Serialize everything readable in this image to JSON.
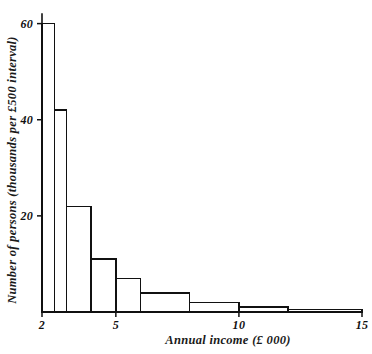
{
  "chart_data": {
    "type": "bar",
    "title": "",
    "subtitle": "",
    "xlabel": "Annual income (£ 000)",
    "ylabel": "Number of persons (thousands per £500 interval)",
    "xlim": [
      2,
      15
    ],
    "ylim": [
      0,
      62
    ],
    "grid": false,
    "legend": null,
    "x_ticks": [
      {
        "value": 2,
        "label": "2"
      },
      {
        "value": 5,
        "label": "5"
      },
      {
        "value": 10,
        "label": "10"
      },
      {
        "value": 15,
        "label": "15"
      }
    ],
    "y_ticks": [
      {
        "value": 20,
        "label": "20"
      },
      {
        "value": 40,
        "label": "40"
      },
      {
        "value": 60,
        "label": "60"
      }
    ],
    "bin_edges": [
      2,
      2.5,
      3,
      4,
      5,
      6,
      8,
      10,
      12,
      15
    ],
    "categories": [
      "2-2.5",
      "2.5-3",
      "3-4",
      "4-5",
      "5-6",
      "6-8",
      "8-10",
      "10-12",
      "12-15"
    ],
    "values": [
      60,
      42,
      22,
      11,
      7,
      4,
      2,
      1,
      0.5
    ],
    "bars": [
      {
        "x0": 2,
        "x1": 2.5,
        "height": 60
      },
      {
        "x0": 2.5,
        "x1": 3,
        "height": 42
      },
      {
        "x0": 3,
        "x1": 4,
        "height": 22
      },
      {
        "x0": 4,
        "x1": 5,
        "height": 11
      },
      {
        "x0": 5,
        "x1": 6,
        "height": 7
      },
      {
        "x0": 6,
        "x1": 8,
        "height": 4
      },
      {
        "x0": 8,
        "x1": 10,
        "height": 2
      },
      {
        "x0": 10,
        "x1": 12,
        "height": 1
      },
      {
        "x0": 12,
        "x1": 15,
        "height": 0.5
      }
    ],
    "colors": {
      "axis": "#111111",
      "bar_stroke": "#111111",
      "bar_fill": "#ffffff",
      "background": "#ffffff",
      "text": "#111111"
    }
  }
}
